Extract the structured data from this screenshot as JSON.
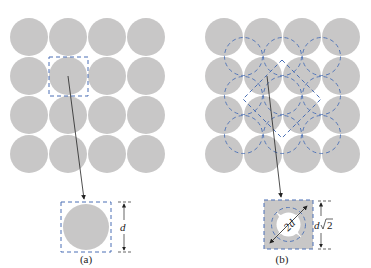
{
  "figure": {
    "panels": [
      {
        "id": "a",
        "caption": "(a)",
        "grid": {
          "rows": 4,
          "cols": 4
        },
        "dimension_label": "d",
        "description": "Square packing of circles; one circle enclosed in a dashed square cell of side d"
      },
      {
        "id": "b",
        "caption": "(b)",
        "grid": {
          "rows": 4,
          "cols": 4
        },
        "dimension_label_base": "d",
        "dimension_label_root": "2",
        "diagonal_label": "2d",
        "description": "Dashed circles and dashed rotated square cell of side d√2 with diagonal 2d"
      }
    ],
    "colors": {
      "circle_fill": "#c8c7c7",
      "dash_stroke": "#4a6fb5",
      "line": "#222222",
      "background": "#ffffff"
    }
  }
}
